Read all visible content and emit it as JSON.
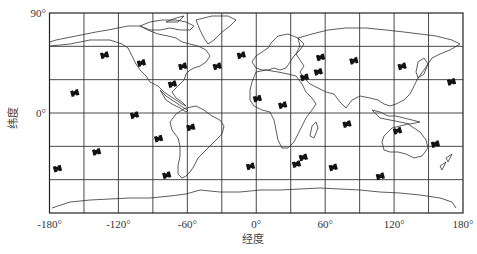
{
  "chart_data": {
    "type": "scatter",
    "title": "",
    "xlabel": "经度",
    "ylabel": "纬度",
    "xlim": [
      -180,
      180
    ],
    "ylim": [
      -90,
      90
    ],
    "grid": true,
    "grid_step_deg": 30,
    "x_ticks": [
      {
        "value": -180,
        "label": "-180°"
      },
      {
        "value": -120,
        "label": "-120°"
      },
      {
        "value": -60,
        "label": "-60°"
      },
      {
        "value": 0,
        "label": "0°"
      },
      {
        "value": 60,
        "label": "60°"
      },
      {
        "value": 120,
        "label": "120°"
      },
      {
        "value": 180,
        "label": "180°"
      }
    ],
    "y_ticks": [
      {
        "value": 90,
        "label": "90°"
      },
      {
        "value": 0,
        "label": "0°"
      }
    ],
    "background": "world map outline (continents)",
    "marker": "satellite-icon",
    "marker_color": "#111111",
    "series": [
      {
        "name": "satellites",
        "points": [
          {
            "lon": -132,
            "lat": 52
          },
          {
            "lon": -100,
            "lat": 45
          },
          {
            "lon": -64,
            "lat": 42
          },
          {
            "lon": -34,
            "lat": 42
          },
          {
            "lon": -13,
            "lat": 52
          },
          {
            "lon": -73,
            "lat": 26
          },
          {
            "lon": -158,
            "lat": 18
          },
          {
            "lon": 1,
            "lat": 13
          },
          {
            "lon": 56,
            "lat": 50
          },
          {
            "lon": 54,
            "lat": 37
          },
          {
            "lon": 42,
            "lat": 32
          },
          {
            "lon": 85,
            "lat": 47
          },
          {
            "lon": 127,
            "lat": 42
          },
          {
            "lon": 170,
            "lat": 28
          },
          {
            "lon": 23,
            "lat": 7
          },
          {
            "lon": -106,
            "lat": -2
          },
          {
            "lon": -57,
            "lat": -13
          },
          {
            "lon": -85,
            "lat": -23
          },
          {
            "lon": -139,
            "lat": -35
          },
          {
            "lon": -173,
            "lat": -50
          },
          {
            "lon": -78,
            "lat": -56
          },
          {
            "lon": -5,
            "lat": -48
          },
          {
            "lon": 79,
            "lat": -10
          },
          {
            "lon": 123,
            "lat": -16
          },
          {
            "lon": 156,
            "lat": -28
          },
          {
            "lon": 41,
            "lat": -40
          },
          {
            "lon": 35,
            "lat": -46
          },
          {
            "lon": 67,
            "lat": -49
          },
          {
            "lon": 108,
            "lat": -57
          }
        ]
      }
    ]
  },
  "labels": {
    "xlabel": "经度",
    "ylabel": "纬度"
  }
}
